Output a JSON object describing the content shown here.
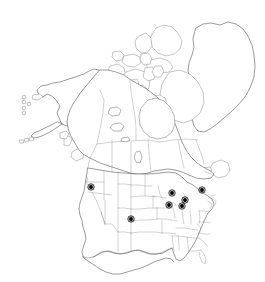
{
  "figure": {
    "kind": "distribution-map",
    "region": "North America",
    "caption_cutoff": "",
    "background_color": "#ffffff",
    "coastline_color": "#4a4a4a",
    "border_color": "#6b6b6b",
    "subdivision_color": "#8a8a8a",
    "dot_color": "#000000"
  },
  "chart_data": {
    "type": "scatter",
    "title": "",
    "xlabel": "",
    "ylabel": "",
    "projection": "conic",
    "grid": false,
    "legend": null,
    "basemap": {
      "countries": [
        "Canada",
        "United States",
        "Mexico",
        "Greenland"
      ],
      "subdivisions_drawn": true,
      "lakes_drawn": true
    },
    "series": [
      {
        "name": "occurrence-records",
        "marker": "filled-circle",
        "color": "#000000",
        "count": 7,
        "points": [
          {
            "label": "Oregon",
            "x": 91,
            "y": 187
          },
          {
            "label": "Colorado",
            "x": 131,
            "y": 219
          },
          {
            "label": "Iowa",
            "x": 169,
            "y": 205
          },
          {
            "label": "Wisconsin",
            "x": 172,
            "y": 193
          },
          {
            "label": "Illinois-Indiana",
            "x": 182,
            "y": 206
          },
          {
            "label": "Michigan",
            "x": 185,
            "y": 200
          },
          {
            "label": "New York",
            "x": 202,
            "y": 190
          }
        ]
      }
    ]
  }
}
